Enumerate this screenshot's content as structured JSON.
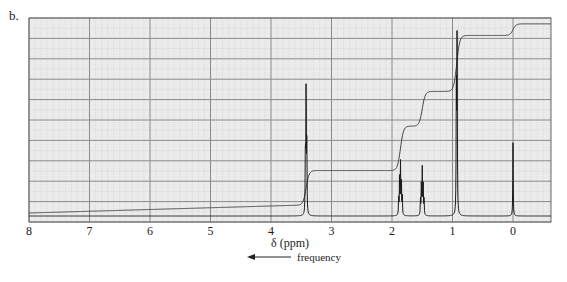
{
  "figure": {
    "panel_label": "b.",
    "xlabel": "δ (ppm)",
    "direction_label": "frequency",
    "arrow_icon": "left-arrow"
  },
  "colors": {
    "grid_background": "#ebebeb",
    "major_grid": "#8a8a8a",
    "minor_grid": "#c8c8c8",
    "trace": "#1a1a1a",
    "integral": "#444444"
  },
  "chart_data": {
    "type": "line",
    "title": "",
    "subtitle": "1H NMR spectrum with integration curve",
    "xlabel": "δ (ppm)",
    "ylabel": "",
    "xlim": [
      8,
      -0.6
    ],
    "x_reversed": true,
    "x_ticks": [
      8,
      7,
      6,
      5,
      4,
      3,
      2,
      1,
      0
    ],
    "grid": true,
    "legend": null,
    "annotations": [
      "b.",
      "← frequency"
    ],
    "series": [
      {
        "name": "spectrum",
        "peaks": [
          {
            "shift_ppm": 3.42,
            "relative_height": 0.68,
            "multiplicity": "triplet"
          },
          {
            "shift_ppm": 1.86,
            "relative_height": 0.26,
            "multiplicity": "multiplet"
          },
          {
            "shift_ppm": 1.5,
            "relative_height": 0.23,
            "multiplicity": "multiplet"
          },
          {
            "shift_ppm": 0.93,
            "relative_height": 0.98,
            "multiplicity": "doublet"
          },
          {
            "shift_ppm": 0.0,
            "relative_height": 0.37,
            "multiplicity": "singlet",
            "note": "TMS"
          }
        ]
      },
      {
        "name": "integral",
        "steps": [
          {
            "shift_ppm": 3.42,
            "level_after": 0.22
          },
          {
            "shift_ppm": 1.86,
            "level_after": 0.45
          },
          {
            "shift_ppm": 1.5,
            "level_after": 0.63
          },
          {
            "shift_ppm": 0.93,
            "level_after": 0.92
          },
          {
            "shift_ppm": 0.0,
            "level_after": 0.98
          }
        ]
      }
    ]
  }
}
